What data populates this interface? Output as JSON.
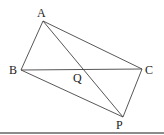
{
  "diagram": {
    "type": "geometry-figure",
    "points": {
      "A": {
        "label": "A",
        "x": 43,
        "y": 21
      },
      "B": {
        "label": "B",
        "x": 21,
        "y": 70
      },
      "C": {
        "label": "C",
        "x": 142,
        "y": 69
      },
      "P": {
        "label": "P",
        "x": 123,
        "y": 117
      },
      "Q": {
        "label": "Q",
        "x": 82,
        "y": 69
      }
    },
    "segments": [
      "AB",
      "AC",
      "BC",
      "BP",
      "CP",
      "AP"
    ],
    "line_color": "#444444",
    "baseline_color": "#666666"
  }
}
